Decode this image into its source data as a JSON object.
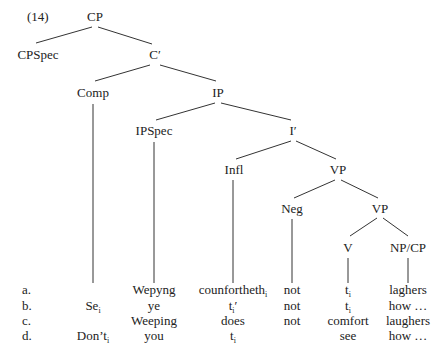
{
  "example_number": "(14)",
  "tree": {
    "nodes": {
      "cp": "CP",
      "cpspec": "CPSpec",
      "c_bar": "C′",
      "comp": "Comp",
      "ip": "IP",
      "ipspec": "IPSpec",
      "i_bar": "I′",
      "infl": "Infl",
      "vp1": "VP",
      "neg": "Neg",
      "vp2": "VP",
      "v": "V",
      "npcp": "NP/CP"
    }
  },
  "rows": [
    {
      "letter": "a.",
      "comp": "",
      "ipspec": "Wepyng",
      "infl": "counfortheth",
      "infl_sub": "i",
      "neg": "not",
      "v": "t",
      "v_sub": "i",
      "npcp": "laghers"
    },
    {
      "letter": "b.",
      "comp": "Se",
      "comp_sub": "i",
      "ipspec": "ye",
      "infl": "t",
      "infl_sub": "i",
      "infl_prime": "′",
      "neg": "not",
      "v": "t",
      "v_sub": "i",
      "npcp": "how …"
    },
    {
      "letter": "c.",
      "comp": "",
      "ipspec": "Weeping",
      "infl": "does",
      "neg": "not",
      "v": "comfort",
      "npcp": "laughers"
    },
    {
      "letter": "d.",
      "comp": "Don’t",
      "comp_sub": "i",
      "ipspec": "you",
      "infl": "t",
      "infl_sub": "i",
      "neg": "",
      "v": "see",
      "npcp": "how …"
    }
  ]
}
